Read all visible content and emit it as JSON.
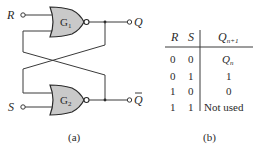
{
  "figure": {
    "circuit": {
      "inputs": [
        {
          "label": "R"
        },
        {
          "label": "S"
        }
      ],
      "gates": [
        {
          "label": "G",
          "subscript": "1",
          "type": "NOR"
        },
        {
          "label": "G",
          "subscript": "2",
          "type": "NOR"
        }
      ],
      "outputs": [
        {
          "label": "Q"
        },
        {
          "label": "Q",
          "overbar": true
        }
      ],
      "caption": "(a)"
    },
    "truth_table": {
      "headers": {
        "r": "R",
        "s": "S",
        "q_base": "Q",
        "q_sub": "n+1"
      },
      "rows": [
        {
          "r": "0",
          "s": "0",
          "q": "Q",
          "q_sub": "n"
        },
        {
          "r": "0",
          "s": "1",
          "q": "1",
          "q_sub": ""
        },
        {
          "r": "1",
          "s": "0",
          "q": "0",
          "q_sub": ""
        },
        {
          "r": "1",
          "s": "1",
          "q": "Not used",
          "q_sub": ""
        }
      ],
      "caption": "(b)"
    }
  }
}
